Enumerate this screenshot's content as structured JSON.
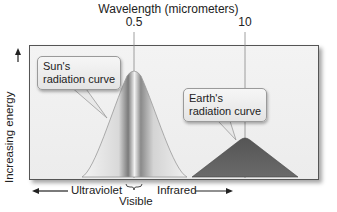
{
  "diagram": {
    "title": "Wavelength (micrometers)",
    "ticks": [
      {
        "label": "0.5",
        "x": 134
      },
      {
        "label": "10",
        "x": 245
      }
    ],
    "y_axis_label": "Increasing energy",
    "callouts": {
      "sun": {
        "line1": "Sun's",
        "line2": "radiation curve"
      },
      "earth": {
        "line1": "Earth's",
        "line2": "radiation curve"
      }
    },
    "bottom_labels": {
      "ultraviolet": "Ultraviolet",
      "visible": "Visible",
      "infrared": "Infrared"
    },
    "colors": {
      "frame_bg": "#efefef",
      "sun_curve_light": "#e6e6e6",
      "sun_curve_dark": "#8a8a8a",
      "earth_curve": "#5f5f5f",
      "axis": "#222222"
    }
  }
}
